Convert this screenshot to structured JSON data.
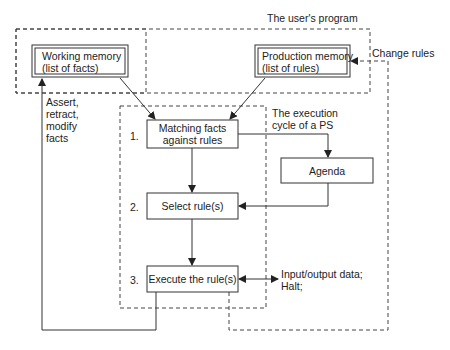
{
  "diagram": {
    "title": "The user's program",
    "working_memory": {
      "line1": "Working memory",
      "line2": "(list of facts)"
    },
    "production_memory": {
      "line1": "Production memory",
      "line2": "(list of rules)"
    },
    "change_rules": "Change rules",
    "assert_label": {
      "line1": "Assert,",
      "line2": "retract,",
      "line3": "modify",
      "line4": "facts"
    },
    "exec_cycle": {
      "line1": "The execution",
      "line2": "cycle of a PS"
    },
    "steps": [
      {
        "num": "1.",
        "line1": "Matching facts",
        "line2": "against rules"
      },
      {
        "num": "2.",
        "line1": "Select rule(s)"
      },
      {
        "num": "3.",
        "line1": "Execute the rule(s)"
      }
    ],
    "agenda": "Agenda",
    "io_label": {
      "line1": "Input/output data;",
      "line2": "Halt;"
    }
  }
}
